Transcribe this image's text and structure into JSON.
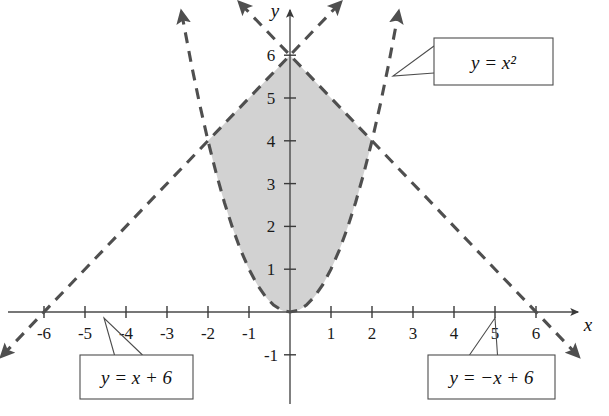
{
  "figure": {
    "kind": "coordinate-plane-graph",
    "background_color": "#ffffff",
    "shade_color": "#d2d2d2",
    "curve_color": "#4f4f4f",
    "axis_color": "#4a4a4a",
    "text_color": "#111111"
  },
  "axes": {
    "x_label": "x",
    "y_label": "y",
    "x_ticks": [
      "-6",
      "-5",
      "-4",
      "-3",
      "-2",
      "-1",
      "1",
      "2",
      "3",
      "4",
      "5",
      "6"
    ],
    "x_tick_values": [
      -6,
      -5,
      -4,
      -3,
      -2,
      -1,
      1,
      2,
      3,
      4,
      5,
      6
    ],
    "y_ticks": [
      "-1",
      "1",
      "2",
      "3",
      "4",
      "5",
      "6"
    ],
    "y_tick_values": [
      -1,
      1,
      2,
      3,
      4,
      5,
      6
    ],
    "origin_label": "",
    "x_range": [
      -7.1,
      7.7
    ],
    "y_range": [
      -2.4,
      7.2
    ]
  },
  "callouts": [
    {
      "id": "parabola-callout",
      "text": "y = x²",
      "text_plain": "y = x2",
      "box": {
        "x": 434,
        "y": 38,
        "w": 119,
        "h": 47
      },
      "anchor": {
        "x": 393,
        "y": 76
      }
    },
    {
      "id": "line-left-callout",
      "text": "y = x + 6",
      "text_plain": "y = x + 6",
      "box": {
        "x": 80,
        "y": 355,
        "w": 113,
        "h": 44
      },
      "anchor": {
        "x": 104,
        "y": 318
      }
    },
    {
      "id": "line-right-callout",
      "text": "y = −x + 6",
      "text_plain": "y = -x + 6",
      "box": {
        "x": 428,
        "y": 355,
        "w": 127,
        "h": 44
      },
      "anchor": {
        "x": 495,
        "y": 318
      }
    }
  ],
  "chart_data": {
    "type": "line",
    "title": "",
    "xlabel": "x",
    "ylabel": "y",
    "xlim": [
      -7.1,
      7.7
    ],
    "ylim": [
      -2.4,
      7.2
    ],
    "grid": false,
    "legend": "callout-boxes",
    "xticks": [
      -6,
      -5,
      -4,
      -3,
      -2,
      -1,
      1,
      2,
      3,
      4,
      5,
      6
    ],
    "yticks": [
      -1,
      1,
      2,
      3,
      4,
      5,
      6
    ],
    "series": [
      {
        "name": "y = x²",
        "equation": "y = x^2",
        "style": "dashed",
        "arrows": "both-ends-up",
        "x": [
          -2.64,
          -2.4,
          -2.2,
          -2.0,
          -1.8,
          -1.6,
          -1.4,
          -1.2,
          -1.0,
          -0.8,
          -0.6,
          -0.4,
          -0.2,
          0,
          0.2,
          0.4,
          0.6,
          0.8,
          1.0,
          1.2,
          1.4,
          1.6,
          1.8,
          2.0,
          2.2,
          2.4,
          2.64
        ],
        "y": [
          6.97,
          5.76,
          4.84,
          4.0,
          3.24,
          2.56,
          1.96,
          1.44,
          1.0,
          0.64,
          0.36,
          0.16,
          0.04,
          0,
          0.04,
          0.16,
          0.36,
          0.64,
          1.0,
          1.44,
          1.96,
          2.56,
          3.24,
          4.0,
          4.84,
          5.76,
          6.97
        ]
      },
      {
        "name": "y = x + 6",
        "equation": "y = x + 6",
        "style": "dashed",
        "arrows": "both-ends",
        "x": [
          -7.0,
          1.2
        ],
        "y": [
          -1.0,
          7.2
        ]
      },
      {
        "name": "y = −x + 6",
        "equation": "y = -x + 6",
        "style": "dashed",
        "arrows": "both-ends",
        "x": [
          -1.2,
          7.0
        ],
        "y": [
          7.2,
          -1.0
        ]
      }
    ],
    "shaded_region": {
      "description": "Region satisfying y ≥ x², y ≤ x + 6, y ≤ −x + 6",
      "fill": "#d2d2d2",
      "vertices": [
        {
          "x": 0,
          "y": 0,
          "label": "origin"
        },
        {
          "x": -2,
          "y": 4,
          "label": "parabola meets y = x + 6"
        },
        {
          "x": 0,
          "y": 6,
          "label": "lines intersect"
        },
        {
          "x": 2,
          "y": 4,
          "label": "parabola meets y = −x + 6"
        }
      ]
    },
    "key_points": [
      {
        "x": 0,
        "y": 6,
        "note": "intersection of the two lines"
      },
      {
        "x": -2,
        "y": 4,
        "note": "y = x² meets y = x + 6"
      },
      {
        "x": 2,
        "y": 4,
        "note": "y = x² meets y = −x + 6"
      },
      {
        "x": 0,
        "y": 0,
        "note": "vertex of parabola"
      }
    ]
  }
}
